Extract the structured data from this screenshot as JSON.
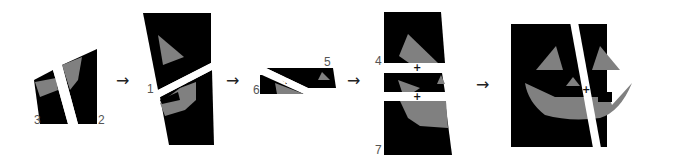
{
  "diagram": {
    "colors": {
      "piece": "#000000",
      "face_feature": "#808080",
      "background": "#ffffff",
      "label": "#555555"
    },
    "arrows": [
      "→",
      "→",
      "→",
      "→"
    ],
    "plus_marker": "+",
    "stages": [
      {
        "id": "stage-1",
        "labels": [
          "3",
          "2"
        ]
      },
      {
        "id": "stage-2",
        "labels": [
          "1"
        ]
      },
      {
        "id": "stage-3",
        "labels": [
          "6",
          "5"
        ]
      },
      {
        "id": "stage-4",
        "labels": [
          "4",
          "7"
        ]
      },
      {
        "id": "stage-5",
        "labels": []
      }
    ]
  }
}
